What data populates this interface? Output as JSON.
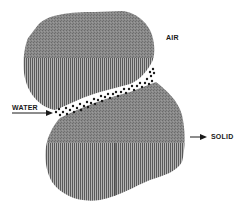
{
  "diagram": {
    "type": "soil particle schematic",
    "labels": {
      "air": "AIR",
      "water": "WATER",
      "solid": "SOLID"
    },
    "components": [
      {
        "name": "upper-solid-particle",
        "fill": "stippled gray top, vertical stripes bottom"
      },
      {
        "name": "lower-solid-particle",
        "fill": "stippled gray top, vertical stripes bottom"
      },
      {
        "name": "water-meniscus",
        "fill": "dark dots between particles"
      }
    ],
    "colors": {
      "particle_gray": "#7a7a7a",
      "stripe_dark": "#5a5a5a",
      "stripe_light": "#b0b0b0",
      "water_dot": "#1a1a1a",
      "label": "#1a1a1a",
      "background": "#ffffff"
    }
  }
}
